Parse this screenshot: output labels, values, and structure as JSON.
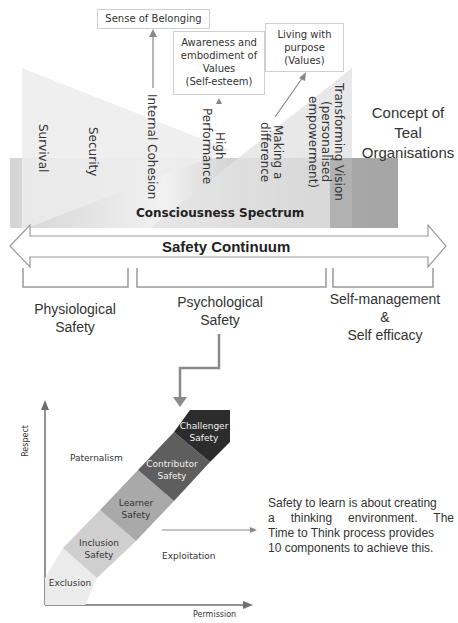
{
  "top_boxes": {
    "belonging": "Sense of Belonging",
    "values_lines": [
      "Awareness and",
      "embodiment of",
      "Values",
      "(Self-esteem)"
    ],
    "purpose_lines": [
      "Living with",
      "purpose",
      "(Values)"
    ]
  },
  "levels": [
    {
      "label": "Survival"
    },
    {
      "label": "Security"
    },
    {
      "label": "Internal Cohesion"
    },
    {
      "label": "High\nPerformance"
    },
    {
      "label": "Making a\ndifference"
    },
    {
      "label": "Transforming Vision\n(personalised\nempowerment)"
    }
  ],
  "teal_lines": [
    "Concept of",
    "Teal",
    "Organisations"
  ],
  "spectrum_label": "Consciousness Spectrum",
  "continuum_label": "Safety Continuum",
  "categories": [
    {
      "lines": [
        "Physiological",
        "Safety"
      ]
    },
    {
      "lines": [
        "Psychological",
        "Safety"
      ]
    },
    {
      "lines": [
        "Self-management",
        "&",
        "Self efficacy"
      ]
    }
  ],
  "safety_chart": {
    "y_axis": "Respect",
    "x_axis": "Permission",
    "quadrant_top": "Paternalism",
    "quadrant_bottom": "Exploitation",
    "stages": [
      {
        "lines": [
          "Exclusion"
        ],
        "color": "#ececec"
      },
      {
        "lines": [
          "Inclusion",
          "Safety"
        ],
        "color": "#cfcfcf"
      },
      {
        "lines": [
          "Learner",
          "Safety"
        ],
        "color": "#a9a9a9"
      },
      {
        "lines": [
          "Contributor",
          "Safety"
        ],
        "color": "#5e5e5e"
      },
      {
        "lines": [
          "Challenger",
          "Safety"
        ],
        "color": "#2c2c2c"
      }
    ]
  },
  "description_lines": [
    "Safety to learn is about creating",
    "a thinking environment. The",
    "Time to Think process provides",
    "10 components to achieve this."
  ]
}
